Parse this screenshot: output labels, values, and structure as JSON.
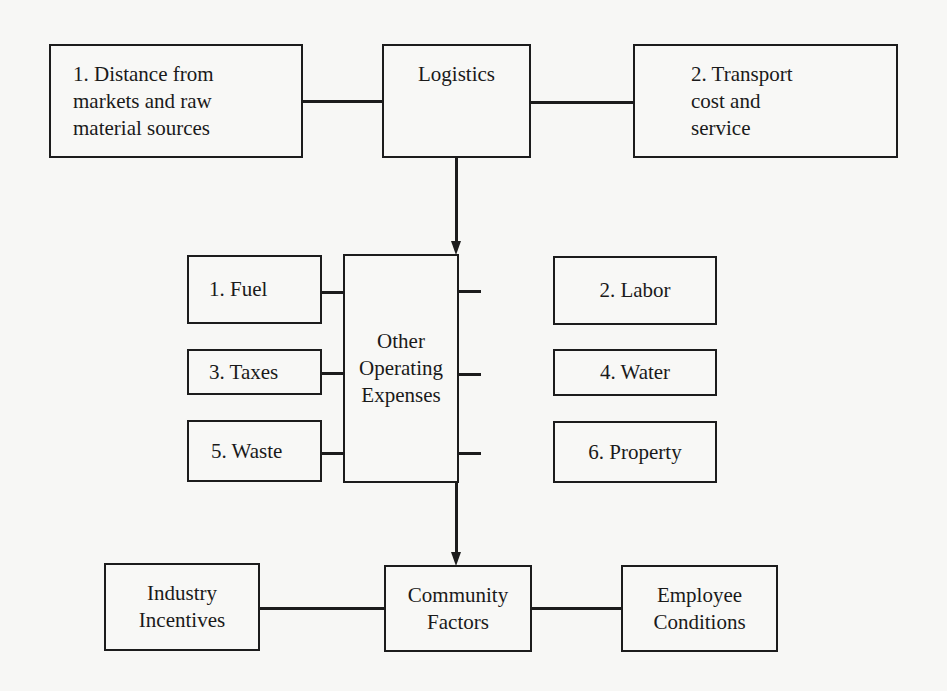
{
  "diagram": {
    "top_row": {
      "left": {
        "lines": [
          "1.  Distance from",
          "markets and raw",
          "material sources"
        ]
      },
      "center": {
        "label": "Logistics"
      },
      "right": {
        "lines": [
          "2.  Transport",
          "cost and",
          "service"
        ]
      }
    },
    "middle_row": {
      "center": {
        "lines": [
          "Other",
          "Operating",
          "Expenses"
        ]
      },
      "left_items": [
        "1.  Fuel",
        "3.  Taxes",
        "5.  Waste"
      ],
      "right_items": [
        "2.  Labor",
        "4.  Water",
        "6.  Property"
      ]
    },
    "bottom_row": {
      "left": {
        "lines": [
          "Industry",
          "Incentives"
        ]
      },
      "center": {
        "lines": [
          "Community",
          "Factors"
        ]
      },
      "right": {
        "lines": [
          "Employee",
          "Conditions"
        ]
      }
    },
    "edges": [
      {
        "from": "Logistics",
        "to": "Other Operating Expenses",
        "type": "arrow"
      },
      {
        "from": "Other Operating Expenses",
        "to": "Community Factors",
        "type": "arrow"
      },
      {
        "from": "1. Distance from markets and raw material sources",
        "to": "Logistics",
        "type": "line"
      },
      {
        "from": "Logistics",
        "to": "2. Transport cost and service",
        "type": "line"
      },
      {
        "from": "Industry Incentives",
        "to": "Community Factors",
        "type": "line"
      },
      {
        "from": "Community Factors",
        "to": "Employee Conditions",
        "type": "line"
      }
    ]
  }
}
